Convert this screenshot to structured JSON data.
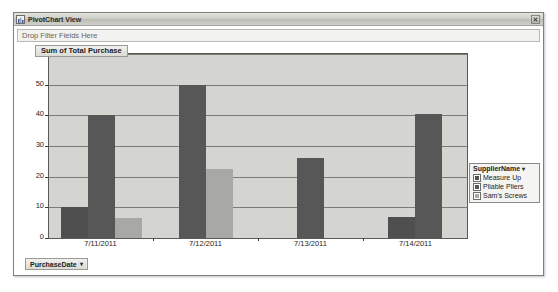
{
  "window": {
    "title": "PivotChart View",
    "title_icon": "pivotchart-icon",
    "close_label": "×"
  },
  "filter_zone": {
    "label": "Drop Filter Fields Here"
  },
  "value_field_button": {
    "label": "Sum of Total Purchase"
  },
  "category_field_button": {
    "label": "PurchaseDate",
    "caret": "▾"
  },
  "legend": {
    "header": "SupplierName",
    "caret": "▾",
    "items": [
      {
        "label": "Measure Up",
        "color": "#4f4f4f"
      },
      {
        "label": "Pliable Pliers",
        "color": "#575757"
      },
      {
        "label": "Sam's Screws",
        "color": "#a8a8a4"
      }
    ]
  },
  "chart_data": {
    "type": "bar",
    "title": "Sum of Total Purchase",
    "xlabel": "PurchaseDate",
    "ylabel": "Sum of Total Purchase",
    "categories": [
      "7/11/2011",
      "7/12/2011",
      "7/13/2011",
      "7/14/2011"
    ],
    "yticks": [
      0,
      10,
      20,
      30,
      40,
      50,
      60
    ],
    "ylim": [
      0,
      60
    ],
    "grid": true,
    "legend_position": "right",
    "series": [
      {
        "name": "Measure Up",
        "color": "#4f4f4f",
        "values": [
          10,
          null,
          null,
          7
        ]
      },
      {
        "name": "Pliable Pliers",
        "color": "#575757",
        "values": [
          40,
          50,
          26,
          40.5
        ]
      },
      {
        "name": "Sam's Screws",
        "color": "#a8a8a4",
        "values": [
          6.5,
          22.5,
          null,
          null
        ]
      }
    ]
  }
}
